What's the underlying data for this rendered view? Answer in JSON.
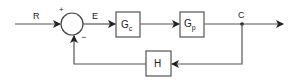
{
  "diagram": {
    "type": "feedback-control-block-diagram",
    "colors": {
      "line": "#555555",
      "stroke": "#444444",
      "text": "#222222",
      "background": "#ffffff"
    },
    "signals": {
      "input": "R",
      "error": "E",
      "output": "C"
    },
    "summing_junction": {
      "plus_sign": "+",
      "minus_sign": "−"
    },
    "blocks": {
      "controller": {
        "main": "G",
        "sub": "c"
      },
      "plant": {
        "main": "G",
        "sub": "p"
      },
      "feedback": {
        "main": "H"
      }
    }
  }
}
